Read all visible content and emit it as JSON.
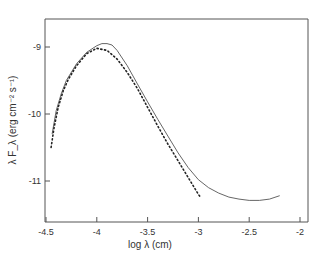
{
  "chart_data": {
    "type": "line",
    "title": "",
    "xlabel": "log  λ (cm)",
    "ylabel": "λ F_λ (erg cm⁻² s⁻¹)",
    "xlim": [
      -4.5,
      -1.9
    ],
    "ylim": [
      -11.6,
      -8.6
    ],
    "grid": false,
    "legend": null,
    "x_ticks": [
      -4.5,
      -4,
      -3.5,
      -3,
      -2.5,
      -2
    ],
    "x_tick_labels": [
      "-4.5",
      "-4",
      "-3.5",
      "-3",
      "-2.5",
      "-2"
    ],
    "y_ticks": [
      -9,
      -10,
      -11
    ],
    "y_tick_labels": [
      "-9",
      "-10",
      "-11"
    ],
    "series": [
      {
        "name": "solid",
        "style": "solid",
        "x": [
          -4.44,
          -4.4,
          -4.35,
          -4.3,
          -4.2,
          -4.1,
          -4.0,
          -3.95,
          -3.9,
          -3.85,
          -3.8,
          -3.7,
          -3.6,
          -3.5,
          -3.4,
          -3.3,
          -3.2,
          -3.1,
          -3.0,
          -2.9,
          -2.8,
          -2.7,
          -2.6,
          -2.5,
          -2.4,
          -2.3,
          -2.2
        ],
        "y": [
          -10.3,
          -9.95,
          -9.7,
          -9.5,
          -9.25,
          -9.08,
          -8.98,
          -8.95,
          -8.95,
          -8.97,
          -9.05,
          -9.28,
          -9.55,
          -9.82,
          -10.08,
          -10.33,
          -10.58,
          -10.8,
          -10.98,
          -11.1,
          -11.18,
          -11.24,
          -11.27,
          -11.29,
          -11.29,
          -11.27,
          -11.22
        ]
      },
      {
        "name": "dotted",
        "style": "dotted",
        "x": [
          -4.45,
          -4.42,
          -4.38,
          -4.33,
          -4.28,
          -4.2,
          -4.1,
          -4.0,
          -3.9,
          -3.8,
          -3.7,
          -3.6,
          -3.5,
          -3.4,
          -3.3,
          -3.2,
          -3.1,
          -3.0,
          -2.98
        ],
        "y": [
          -10.5,
          -10.2,
          -9.9,
          -9.65,
          -9.48,
          -9.28,
          -9.1,
          -9.02,
          -9.05,
          -9.18,
          -9.38,
          -9.62,
          -9.9,
          -10.18,
          -10.45,
          -10.7,
          -10.95,
          -11.2,
          -11.24
        ]
      }
    ]
  }
}
